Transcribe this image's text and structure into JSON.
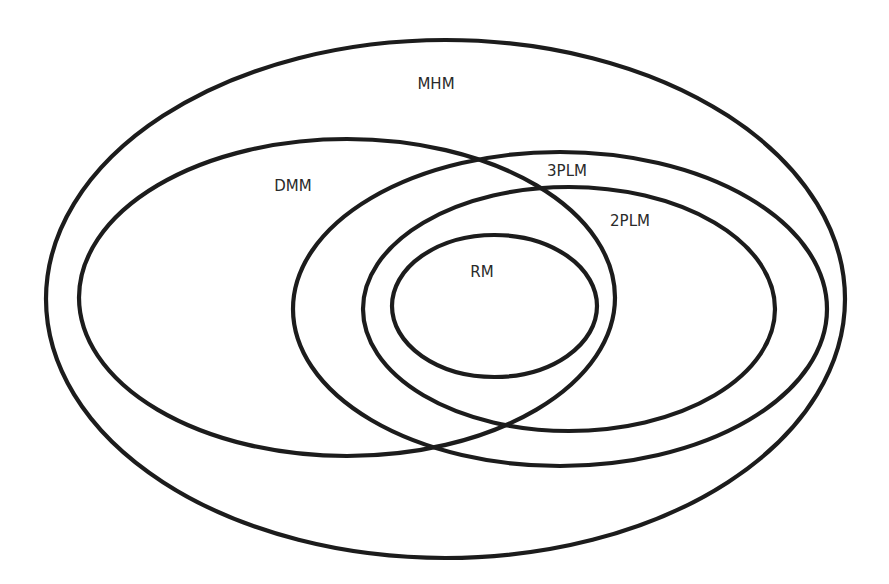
{
  "diagram": {
    "type": "euler-diagram",
    "stroke_color": "#1c1c1c",
    "label_color": "#2a2a2a",
    "background": "#ffffff",
    "sets": [
      {
        "id": "mhm",
        "label": "MHM",
        "cx": 445.5,
        "cy": 299,
        "rx": 399.5,
        "ry": 259,
        "label_x": 436,
        "label_y": 84
      },
      {
        "id": "dmm",
        "label": "DMM",
        "cx": 347,
        "cy": 297.5,
        "rx": 268,
        "ry": 158.5,
        "label_x": 293,
        "label_y": 186
      },
      {
        "id": "3plm",
        "label": "3PLM",
        "cx": 560,
        "cy": 309,
        "rx": 267,
        "ry": 157,
        "label_x": 567,
        "label_y": 171
      },
      {
        "id": "2plm",
        "label": "2PLM",
        "cx": 569,
        "cy": 309,
        "rx": 206,
        "ry": 122,
        "label_x": 630,
        "label_y": 221
      },
      {
        "id": "rm",
        "label": "RM",
        "cx": 494.5,
        "cy": 306,
        "rx": 102.5,
        "ry": 71,
        "label_x": 482,
        "label_y": 272
      }
    ]
  }
}
